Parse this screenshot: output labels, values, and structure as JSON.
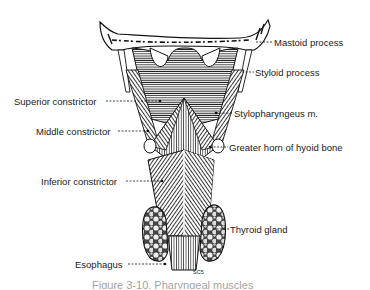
{
  "figure": {
    "labels": {
      "mastoid": "Mastoid process",
      "styloid": "Styloid process",
      "superior_constrictor": "Superior constrictor",
      "stylopharyngeus": "Stylopharyngeus m.",
      "middle_constrictor": "Middle constrictor",
      "hyoid_horn": "Greater horn of hyoid bone",
      "inferior_constrictor": "Inferior constrictor",
      "thyroid": "Thyroid gland",
      "esophagus": "Esophagus"
    },
    "small_mark": "SC5",
    "caption": "Figure 3-10. Pharyngeal muscles"
  }
}
